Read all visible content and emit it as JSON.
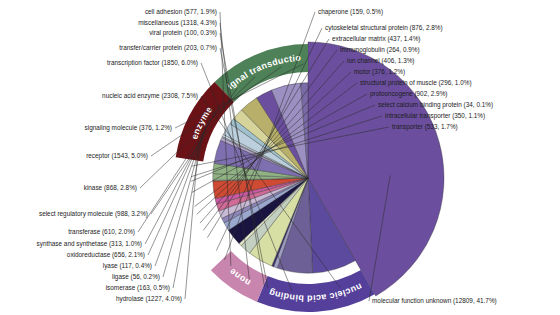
{
  "chart_data": {
    "type": "pie",
    "title": "",
    "total": 30727,
    "center": {
      "x": 308,
      "y": 178
    },
    "radius": 136,
    "start_angle_deg": -90,
    "legend": "none",
    "grid": false,
    "value_format": "name (count, percent)",
    "categories": [
      "molecular function unknown",
      "nucleic acid enzyme",
      "transcription factor",
      "transfer/carrier protein",
      "viral protein",
      "miscellaneous",
      "cell adhesion",
      "chaperone",
      "cytoskeletal structural protein",
      "extracellular matrix",
      "immunoglobulin",
      "ion channel",
      "motor",
      "structural protein of muscle",
      "protooncogene",
      "select calcium binding protein",
      "intracellular transporter",
      "transporter",
      "hydrolase",
      "isomerase",
      "ligase",
      "lyase",
      "oxidoreductase",
      "synthase and synthetase",
      "transferase",
      "select regulatory molecule",
      "kinase",
      "receptor",
      "signaling molecule"
    ],
    "values": [
      12809,
      2308,
      1850,
      203,
      100,
      1318,
      577,
      159,
      876,
      437,
      264,
      406,
      376,
      296,
      902,
      34,
      350,
      533,
      1227,
      163,
      56,
      117,
      656,
      313,
      610,
      988,
      868,
      1543,
      376
    ],
    "percents": [
      41.7,
      7.5,
      6.0,
      0.7,
      0.3,
      4.3,
      1.9,
      0.5,
      2.8,
      1.4,
      0.9,
      1.3,
      1.2,
      1.0,
      2.9,
      0.1,
      1.1,
      1.7,
      4.0,
      0.5,
      0.2,
      0.4,
      2.1,
      1.0,
      2.0,
      3.2,
      2.8,
      5.0,
      1.2
    ],
    "colors": [
      "#6b4f9e",
      "#5b4a9e",
      "#6d6096",
      "#9f9fc4",
      "#3b2e6e",
      "#d8dfa4",
      "#c3cfc0",
      "#dfe5c6",
      "#1a1440",
      "#9aa7cf",
      "#8d85b8",
      "#c8b9d4",
      "#d06a96",
      "#c75aa0",
      "#cf4a33",
      "#d9d9b0",
      "#8fb184",
      "#8fb184",
      "#7e6fb0",
      "#b3a8cc",
      "#c8c0dd",
      "#c9dce4",
      "#bccfdc",
      "#9fc2ce",
      "#d6d49a",
      "#b8b06a",
      "#6b4f9e",
      "#9c8fc2",
      "#7a6aa8"
    ],
    "bands": [
      {
        "label": "nucleic acid binding",
        "color": "#54409a"
      },
      {
        "label": "none",
        "color": "#c886ae"
      },
      {
        "label": "signal transduction",
        "color": "#4e8158"
      },
      {
        "label": "enzyme",
        "color": "#6b1216"
      }
    ]
  },
  "labels": {
    "left_top": [
      {
        "text": "transcription factor (1850, 6.0%)"
      },
      {
        "text": "nucleic acid enzyme (2308, 7.5%)"
      },
      {
        "text": "signaling molecule (376, 1.2%)"
      },
      {
        "text": "receptor (1543, 5.0%)"
      },
      {
        "text": "kinase (868, 2.8%)"
      },
      {
        "text": "select regulatory molecule (988, 3.2%)"
      },
      {
        "text": "transferase (610, 2.0%)"
      },
      {
        "text": "synthase and synthetase (313, 1.0%)"
      },
      {
        "text": "oxidoreductase (656, 2.1%)"
      },
      {
        "text": "lyase (117, 0.4%)"
      },
      {
        "text": "ligase (56, 0.2%)"
      },
      {
        "text": "isomerase (163, 0.5%)"
      },
      {
        "text": "hydrolase (1227, 4.0%)"
      }
    ],
    "top": [
      {
        "text": "cell adhesion (577, 1.9%)"
      },
      {
        "text": "miscellaneous (1318, 4.3%)"
      },
      {
        "text": "viral protein (100, 0.3%)"
      },
      {
        "text": "transfer/carrier protein (203, 0.7%)"
      }
    ],
    "right": [
      {
        "text": "chaperone (159, 0.5%)"
      },
      {
        "text": "cytoskeletal structural protein (876, 2.8%)"
      },
      {
        "text": "extracellular matrix (437, 1.4%)"
      },
      {
        "text": "immunoglobulin (264, 0.9%)"
      },
      {
        "text": "ion channel (406, 1.3%)"
      },
      {
        "text": "motor (376, 1.2%)"
      },
      {
        "text": "structural protein of muscle (296, 1.0%)"
      },
      {
        "text": "protooncogene (902, 2.9%)"
      },
      {
        "text": "select calcium binding protein (34, 0.1%)"
      },
      {
        "text": "intracellular transporter (350, 1.1%)"
      },
      {
        "text": "transporter (533, 1.7%)"
      }
    ],
    "bottom": [
      {
        "text": "molecular function unknown (12809, 41.7%)"
      }
    ]
  }
}
